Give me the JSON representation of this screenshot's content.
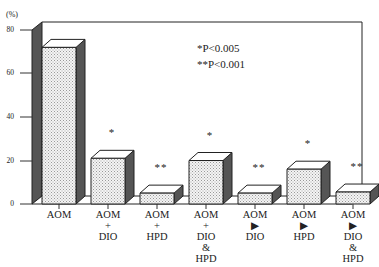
{
  "chart_data": {
    "type": "bar",
    "title": "",
    "xlabel": "",
    "ylabel": "(%)",
    "ylim": [
      0,
      80
    ],
    "yticks": [
      0,
      20,
      40,
      60,
      80
    ],
    "grid": false,
    "style": "3d",
    "categories": [
      "AOM",
      "AOM\n+\nDIO",
      "AOM\n+\nHPD",
      "AOM\n+\nDIO\n&\nHPD",
      "AOM\n→\nDIO",
      "AOM\n→\nHPD",
      "AOM\n→\nDIO\n&\nHPD"
    ],
    "values": [
      72,
      21,
      5,
      20,
      5,
      16,
      5.5
    ],
    "annotations": [
      "",
      "*",
      "**",
      "*",
      "**",
      "*",
      "**"
    ],
    "legend": [
      "*P<0.005",
      "**P<0.001"
    ],
    "legend_position": "upper right"
  },
  "labels": {
    "ylabel": "(%)",
    "ticks": [
      "80",
      "60",
      "40",
      "20",
      "0"
    ],
    "cat": [
      "AOM",
      "AOM\n+\nDIO",
      "AOM\n+\nHPD",
      "AOM\n+\nDIO\n&\nHPD",
      "AOM\n▶\nDIO",
      "AOM\n▶\nHPD",
      "AOM\n▶\nDIO\n&\nHPD"
    ],
    "stars": [
      "",
      "*",
      "**",
      "*",
      "**",
      "*",
      "**"
    ],
    "legend1": "*P<0.005",
    "legend2": "**P<0.001"
  }
}
